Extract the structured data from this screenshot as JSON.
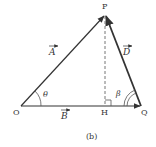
{
  "diagram": {
    "caption": "(b)",
    "points": {
      "O": {
        "label": "O",
        "x": 21,
        "y": 106
      },
      "P": {
        "label": "P",
        "x": 105,
        "y": 15
      },
      "Q": {
        "label": "Q",
        "x": 141,
        "y": 106
      },
      "H": {
        "label": "H",
        "x": 105,
        "y": 106
      }
    },
    "vectors": {
      "A": {
        "label": "A",
        "from": "O",
        "to": "P"
      },
      "B": {
        "label": "B",
        "from": "O",
        "to": "Q"
      },
      "D": {
        "label": "D",
        "from": "Q",
        "to": "P"
      }
    },
    "angles": {
      "theta": {
        "label": "θ",
        "at": "O"
      },
      "beta": {
        "label": "β",
        "at": "Q"
      }
    },
    "perpendicular": {
      "from": "P",
      "foot": "H",
      "style": "dashed",
      "right_angle_marker": true
    },
    "colors": {
      "line": "#333333",
      "dashed": "#777777",
      "background": "#ffffff"
    }
  }
}
